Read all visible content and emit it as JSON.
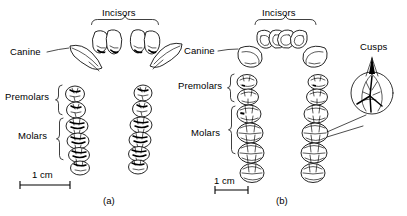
{
  "figure": {
    "background_color": "#ffffff",
    "ink_color": "#000000",
    "panels": [
      {
        "id": "a",
        "caption": "(a)",
        "scale_label": "1 cm",
        "labels": {
          "incisors": "Incisors",
          "canine": "Canine",
          "premolars": "Premolars",
          "molars": "Molars"
        }
      },
      {
        "id": "b",
        "caption": "(b)",
        "scale_label": "1 cm",
        "labels": {
          "incisors": "Incisors",
          "canine": "Canine",
          "premolars": "Premolars",
          "molars": "Molars",
          "cusps": "Cusps"
        }
      }
    ]
  }
}
